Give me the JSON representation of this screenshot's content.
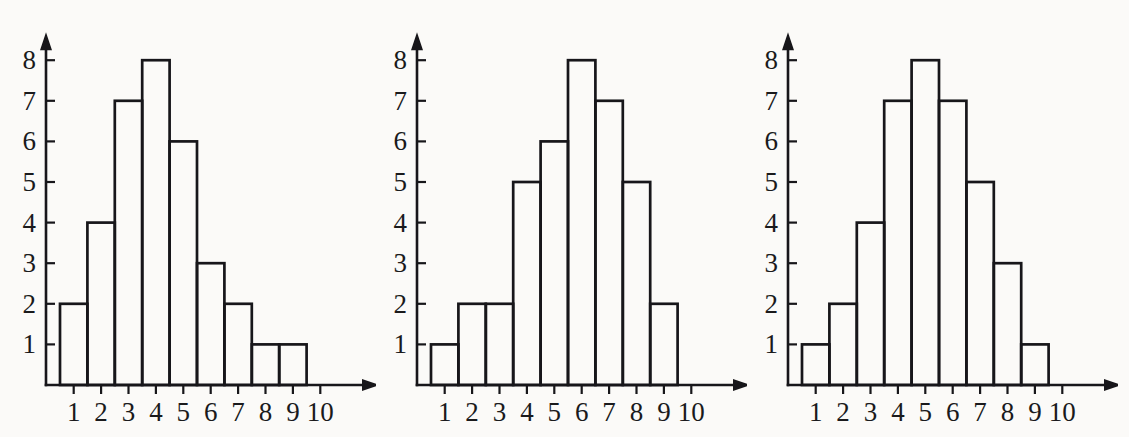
{
  "page": {
    "background_color": "#fbfaf8",
    "ink_color": "#17161a",
    "panel_count": 3
  },
  "chart_data": [
    {
      "type": "bar",
      "title": "",
      "subtitle": "",
      "xlabel": "",
      "ylabel": "",
      "categories": [
        "1",
        "2",
        "3",
        "4",
        "5",
        "6",
        "7",
        "8",
        "9",
        "10"
      ],
      "values": [
        2,
        4,
        7,
        8,
        6,
        3,
        2,
        1,
        1,
        0
      ],
      "x_tick_labels": [
        "1",
        "2",
        "3",
        "4",
        "5",
        "6",
        "7",
        "8",
        "9",
        "10"
      ],
      "y_tick_labels": [
        "1",
        "2",
        "3",
        "4",
        "5",
        "6",
        "7",
        "8"
      ],
      "ylim": [
        0,
        8
      ],
      "xlim": [
        0.5,
        10.5
      ],
      "grid": false,
      "legend": false,
      "legend_position": "none",
      "annotations": [],
      "axis_arrows": true,
      "bars_adjacent": true
    },
    {
      "type": "bar",
      "title": "",
      "subtitle": "",
      "xlabel": "",
      "ylabel": "",
      "categories": [
        "1",
        "2",
        "3",
        "4",
        "5",
        "6",
        "7",
        "8",
        "9",
        "10"
      ],
      "values": [
        1,
        2,
        2,
        5,
        6,
        8,
        7,
        5,
        2,
        0
      ],
      "x_tick_labels": [
        "1",
        "2",
        "3",
        "4",
        "5",
        "6",
        "7",
        "8",
        "9",
        "10"
      ],
      "y_tick_labels": [
        "1",
        "2",
        "3",
        "4",
        "5",
        "6",
        "7",
        "8"
      ],
      "ylim": [
        0,
        8
      ],
      "xlim": [
        0.5,
        10.5
      ],
      "grid": false,
      "legend": false,
      "legend_position": "none",
      "annotations": [],
      "axis_arrows": true,
      "bars_adjacent": true
    },
    {
      "type": "bar",
      "title": "",
      "subtitle": "",
      "xlabel": "",
      "ylabel": "",
      "categories": [
        "1",
        "2",
        "3",
        "4",
        "5",
        "6",
        "7",
        "8",
        "9",
        "10"
      ],
      "values": [
        1,
        2,
        4,
        7,
        8,
        7,
        5,
        3,
        1,
        0
      ],
      "x_tick_labels": [
        "1",
        "2",
        "3",
        "4",
        "5",
        "6",
        "7",
        "8",
        "9",
        "10"
      ],
      "y_tick_labels": [
        "1",
        "2",
        "3",
        "4",
        "5",
        "6",
        "7",
        "8"
      ],
      "ylim": [
        0,
        8
      ],
      "xlim": [
        0.5,
        10.5
      ],
      "grid": false,
      "legend": false,
      "legend_position": "none",
      "annotations": [],
      "axis_arrows": true,
      "bars_adjacent": true
    }
  ]
}
